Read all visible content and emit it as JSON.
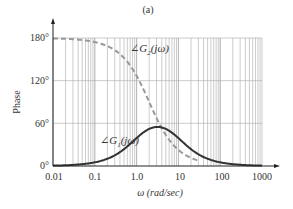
{
  "chart_data": {
    "type": "line",
    "title": "(a)",
    "xlabel": "ω (rad/sec)",
    "ylabel": "Phase",
    "xscale": "log",
    "xlim": [
      0.01,
      1000
    ],
    "ylim": [
      0,
      180
    ],
    "x_ticks": [
      "0.01",
      "0.1",
      "1.0",
      "10",
      "100",
      "1000"
    ],
    "y_ticks": [
      "0°",
      "60°",
      "120°",
      "180°"
    ],
    "grid": true,
    "series": [
      {
        "name": "∠G1(jω)",
        "style": "solid",
        "color": "#333333",
        "x": [
          0.01,
          0.1,
          0.3,
          1,
          2,
          3.16,
          5,
          10,
          30,
          100,
          1000
        ],
        "values": [
          0.5,
          5,
          15,
          39,
          52,
          55,
          52,
          39,
          15,
          5,
          0.5
        ]
      },
      {
        "name": "∠G2(jω)",
        "style": "dashed",
        "color": "#999999",
        "x": [
          0.01,
          0.1,
          0.3,
          1,
          2,
          3,
          5,
          10,
          20,
          30
        ],
        "values": [
          179,
          174,
          163,
          127,
          90,
          67,
          44,
          23,
          11,
          8
        ]
      }
    ]
  },
  "labels": {
    "title": "(a)",
    "ylabel": "Phase",
    "xlabel": "ω (rad/sec)",
    "g1": "∠G",
    "g1_sub": "1",
    "g1_tail": "(jω)",
    "g2": "∠G",
    "g2_sub": "2",
    "g2_tail": "(jω)",
    "yt0": "0°",
    "yt60": "60°",
    "yt120": "120°",
    "yt180": "180°",
    "xt0": "0.01",
    "xt1": "0.1",
    "xt2": "1.0",
    "xt3": "10",
    "xt4": "100",
    "xt5": "1000"
  }
}
